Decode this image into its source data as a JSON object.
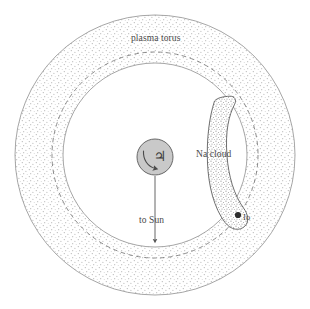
{
  "figure": {
    "background_color": "#ffffff",
    "width": 310,
    "height": 309
  },
  "labels": {
    "plasma_torus": "plasma torus",
    "na_cloud": "Na cloud",
    "to_sun": "to Sun",
    "io": "Io",
    "jupiter_symbol": "♃"
  },
  "colors": {
    "outline": "#8a8a8a",
    "dashed_orbit": "#6e6e6e",
    "stipple": "#b9b9b9",
    "jupiter_fill": "#c9c9c9",
    "jupiter_outline": "#5a5a5a",
    "na_cloud_fill": "#d8d8d8",
    "na_cloud_outline": "#555555",
    "io_fill": "#2b2b2b",
    "text": "#4a4a4a",
    "arrow": "#555555"
  },
  "geometry": {
    "center_x": 155,
    "center_y": 155,
    "outer_torus_radius": 140,
    "inner_torus_radius": 92,
    "io_orbit_radius": 103,
    "jupiter_radius": 18,
    "io_radius": 3,
    "io_x": 238,
    "io_y": 215,
    "sun_arrow_start_y": 176,
    "sun_arrow_end_y": 243
  },
  "elements": [
    {
      "name": "outer-torus-boundary",
      "type": "circle",
      "style": "solid"
    },
    {
      "name": "plasma-torus-band",
      "type": "annulus",
      "style": "stippled"
    },
    {
      "name": "io-orbit",
      "type": "circle",
      "style": "dashed"
    },
    {
      "name": "inner-torus-boundary",
      "type": "circle",
      "style": "solid"
    },
    {
      "name": "jupiter",
      "type": "disc",
      "style": "filled"
    },
    {
      "name": "jupiter-rotation-arrow",
      "type": "arc-arrow"
    },
    {
      "name": "na-cloud",
      "type": "crescent",
      "style": "stippled"
    },
    {
      "name": "io",
      "type": "disc",
      "style": "filled"
    },
    {
      "name": "to-sun-arrow",
      "type": "arrow",
      "direction": "down"
    }
  ]
}
